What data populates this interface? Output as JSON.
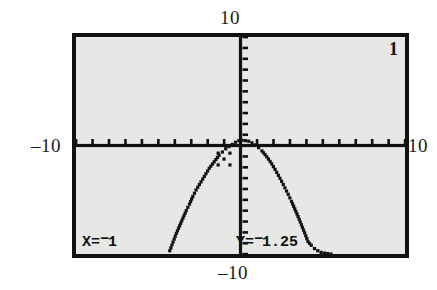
{
  "figure": {
    "number_label": "1",
    "device": "graphing-calculator-screen"
  },
  "window": {
    "ymax_label": "10",
    "ymin_label": "–10",
    "xmin_label": "–10",
    "xmax_label": "10",
    "xmin": -10,
    "xmax": 10,
    "ymin": -10,
    "ymax": 10,
    "xscl": 1,
    "yscl": 1
  },
  "trace": {
    "x_prefix": "X=",
    "x_sign": "−",
    "x_value": "1",
    "x_full": "X=-1",
    "y_prefix": "Y=",
    "y_sign": "−",
    "y_value": "1.25",
    "y_full": "Y=-1.25"
  },
  "colors": {
    "screen_background": "#e7e7e5",
    "screen_border": "#111111",
    "ink": "#111111",
    "page_background": "#ffffff"
  },
  "chart_data": {
    "type": "line",
    "title": "",
    "subtitle": "",
    "xlabel": "",
    "ylabel": "",
    "xlim": [
      -10,
      10
    ],
    "ylim": [
      -10,
      10
    ],
    "grid": false,
    "legend": "none",
    "axis_ticks": {
      "x_tick_step": 1,
      "y_tick_step": 1,
      "x_ticks": [
        -10,
        -9,
        -8,
        -7,
        -6,
        -5,
        -4,
        -3,
        -2,
        -1,
        0,
        1,
        2,
        3,
        4,
        5,
        6,
        7,
        8,
        9,
        10
      ],
      "y_ticks": [
        -10,
        -9,
        -8,
        -7,
        -6,
        -5,
        -4,
        -3,
        -2,
        -1,
        0,
        1,
        2,
        3,
        4,
        5,
        6,
        7,
        8,
        9,
        10
      ]
    },
    "annotations": [
      {
        "name": "trace-cursor",
        "x": -1,
        "y": -1.25,
        "style": "crosshair"
      }
    ],
    "series": [
      {
        "name": "downward-parabola",
        "style": "dotted-pixels",
        "x": [
          -4.3,
          -4.1,
          -3.9,
          -3.7,
          -3.5,
          -3.3,
          -3.1,
          -2.9,
          -2.7,
          -2.5,
          -2.3,
          -2.1,
          -1.9,
          -1.7,
          -1.5,
          -1.3,
          -1.1,
          -0.9,
          -0.7,
          -0.5,
          -0.3,
          -0.1,
          0.1,
          0.3,
          0.5,
          0.7,
          0.9,
          1.1,
          1.3,
          1.5,
          1.7,
          1.9,
          2.1,
          2.3,
          2.5,
          2.7,
          2.9,
          3.1,
          3.3,
          3.5,
          3.7,
          3.9,
          4.1,
          4.3,
          4.5,
          4.7,
          4.9,
          5.1,
          5.3,
          5.5
        ],
        "y": [
          -9.7,
          -8.9,
          -8.1,
          -7.4,
          -6.7,
          -6.0,
          -5.4,
          -4.7,
          -4.1,
          -3.6,
          -3.1,
          -2.6,
          -2.1,
          -1.7,
          -1.3,
          -0.9,
          -0.6,
          -0.3,
          -0.1,
          0.1,
          0.3,
          0.45,
          0.48,
          0.45,
          0.4,
          0.25,
          0.05,
          -0.2,
          -0.5,
          -0.85,
          -1.25,
          -1.7,
          -2.2,
          -2.75,
          -3.3,
          -3.9,
          -4.5,
          -5.15,
          -5.85,
          -6.55,
          -7.3,
          -8.05,
          -8.85,
          -9.2,
          -9.5,
          -9.7,
          -9.85,
          -9.92,
          -9.96,
          -10.0
        ]
      }
    ]
  }
}
